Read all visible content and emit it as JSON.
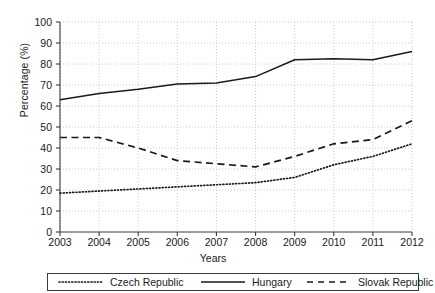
{
  "chart_data": {
    "type": "line",
    "title": "",
    "xlabel": "Years",
    "ylabel": "Percentage (%)",
    "x": [
      2003,
      2004,
      2005,
      2006,
      2007,
      2008,
      2009,
      2010,
      2011,
      2012
    ],
    "xticklabels": [
      "2003",
      "2004",
      "2005",
      "2006",
      "2007",
      "2008",
      "2009",
      "2010",
      "2011",
      "2012"
    ],
    "yticklabels": [
      "0",
      "10",
      "20",
      "30",
      "40",
      "50",
      "60",
      "70",
      "80",
      "90",
      "100"
    ],
    "yticks": [
      0,
      10,
      20,
      30,
      40,
      50,
      60,
      70,
      80,
      90,
      100
    ],
    "xlim": [
      2003,
      2012
    ],
    "ylim": [
      0,
      100
    ],
    "grid": true,
    "grid_style": "dotted",
    "grid_color": "#c8c8c8",
    "legend_position": "bottom",
    "series": [
      {
        "name": "Czech Republic",
        "style": "dotted",
        "color": "#1a1a1a",
        "values": [
          18.5,
          19.5,
          20.5,
          21.5,
          22.5,
          23.5,
          26.0,
          32.0,
          36.0,
          42.0
        ]
      },
      {
        "name": "Hungary",
        "style": "solid",
        "color": "#1a1a1a",
        "values": [
          63.0,
          66.0,
          68.0,
          70.5,
          71.0,
          74.0,
          82.0,
          82.5,
          82.0,
          86.0
        ]
      },
      {
        "name": "Slovak Republic",
        "style": "dashed",
        "color": "#1a1a1a",
        "values": [
          45.0,
          45.0,
          40.0,
          34.0,
          32.5,
          31.0,
          36.0,
          42.0,
          44.0,
          53.0
        ]
      }
    ]
  },
  "legend": {
    "items": [
      {
        "label": "Czech Republic",
        "style": "dotted"
      },
      {
        "label": "Hungary",
        "style": "solid"
      },
      {
        "label": "Slovak Republic",
        "style": "dashed"
      }
    ]
  },
  "axes": {
    "x_title": "Years",
    "y_title": "Percentage (%)"
  }
}
